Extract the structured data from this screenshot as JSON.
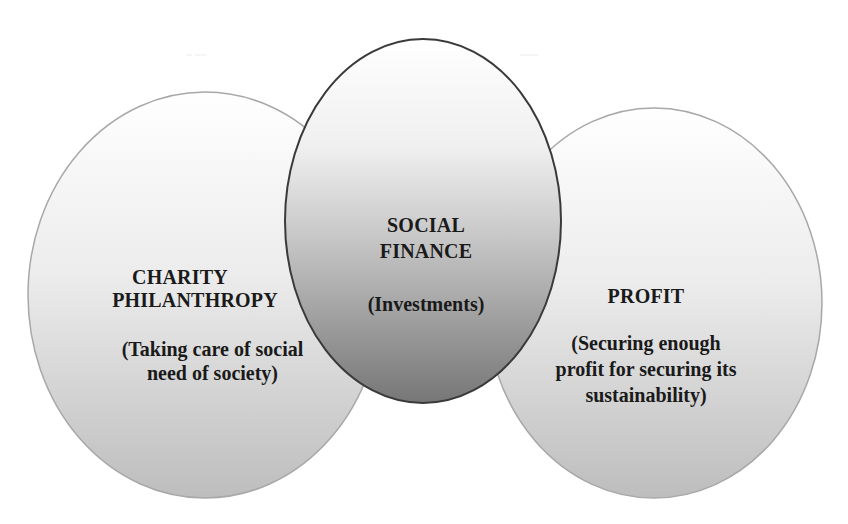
{
  "diagram": {
    "type": "venn-overlap",
    "colors": {
      "outer_top": "#ffffff",
      "outer_bottom": "#bdbdbd",
      "outer_stroke": "#a8a8a8",
      "center_top": "#ffffff",
      "center_mid": "#c6c6c6",
      "center_bottom": "#767676",
      "center_stroke": "#3a3a3a",
      "text": "#1a1a1a"
    },
    "left": {
      "title_line1": "CHARITY",
      "title_line2": "PHILANTHROPY",
      "desc_line1": "(Taking care of social",
      "desc_line2": "need of society)"
    },
    "center": {
      "title_line1": "SOCIAL",
      "title_line2": "FINANCE",
      "desc_line1": "(Investments)"
    },
    "right": {
      "title_line1": "PROFIT",
      "desc_line1": "(Securing enough",
      "desc_line2": "profit for securing its",
      "desc_line3": "sustainability)"
    }
  }
}
